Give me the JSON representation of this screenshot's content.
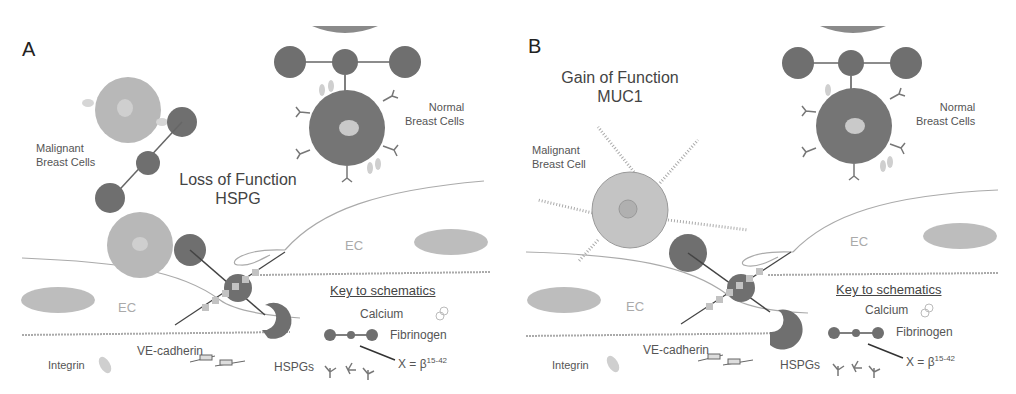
{
  "panels": [
    {
      "letter": "A",
      "title_line1": "Loss of Function",
      "title_line2": "HSPG",
      "malignant_label_line1": "Malignant",
      "malignant_label_line2": "Breast Cells",
      "normal_label_line1": "Normal",
      "normal_label_line2": "Breast Cells",
      "ec_labels": [
        "EC",
        "EC"
      ],
      "legend": {
        "title": "Key to schematics",
        "calcium": "Calcium",
        "fibrinogen": "Fibrinogen",
        "x_label": "X = β",
        "x_sup": "15-42",
        "integrin": "Integrin",
        "ve_cadherin": "VE-cadherin",
        "hspgs": "HSPGs"
      }
    },
    {
      "letter": "B",
      "title_line1": "Gain of Function",
      "title_line2": "MUC1",
      "malignant_label_line1": "Malignant",
      "malignant_label_line2": "Breast Cell",
      "normal_label_line1": "Normal",
      "normal_label_line2": "Breast Cells",
      "ec_labels": [
        "EC",
        "EC"
      ],
      "legend": {
        "title": "Key to schematics",
        "calcium": "Calcium",
        "fibrinogen": "Fibrinogen",
        "x_label": "X = β",
        "x_sup": "15-42",
        "integrin": "Integrin",
        "ve_cadherin": "VE-cadherin",
        "hspgs": "HSPGs"
      }
    }
  ],
  "colors": {
    "dark_cell": "#6f6f6f",
    "malignant_cell": "#b8b8b8",
    "nucleus": "#d0d0d0",
    "ec_nucleus": "#bdbdbd",
    "membrane": "#9a9a9a",
    "integrin": "#cfcfcf"
  }
}
